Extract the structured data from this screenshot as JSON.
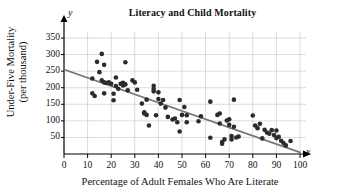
{
  "chart_data": {
    "type": "scatter",
    "title": "Literacy and Child Mortality",
    "xlabel": "Percentage of Adult Females Who Are Literate",
    "ylabel_line1": "Under-Five Mortality",
    "ylabel_line2": "(per thousand)",
    "x_axis_symbol": "x",
    "y_axis_symbol": "y",
    "xlim": [
      0,
      100
    ],
    "ylim": [
      0,
      365
    ],
    "xticks": [
      0,
      10,
      20,
      30,
      40,
      50,
      60,
      70,
      80,
      90,
      100
    ],
    "yticks": [
      50,
      100,
      150,
      200,
      250,
      300,
      350
    ],
    "grid": true,
    "grid_color": "#cccccc",
    "point_color": "#2b2b2b",
    "line_color": "#777777",
    "axis_color": "#000000",
    "trendline": {
      "label": "least-squares regression line",
      "x_start": 0,
      "y_start": 255,
      "x_end": 100,
      "y_end": 5
    },
    "points": [
      [
        12,
        228
      ],
      [
        12,
        183
      ],
      [
        13,
        175
      ],
      [
        14,
        278
      ],
      [
        15,
        247
      ],
      [
        16,
        302
      ],
      [
        16,
        222
      ],
      [
        17,
        269
      ],
      [
        17,
        216
      ],
      [
        17,
        183
      ],
      [
        18,
        214
      ],
      [
        19,
        216
      ],
      [
        20,
        212
      ],
      [
        21,
        182
      ],
      [
        21,
        162
      ],
      [
        22,
        231
      ],
      [
        22,
        205
      ],
      [
        23,
        197
      ],
      [
        24,
        212
      ],
      [
        25,
        215
      ],
      [
        25,
        207
      ],
      [
        26,
        277
      ],
      [
        26,
        210
      ],
      [
        27,
        192
      ],
      [
        29,
        222
      ],
      [
        30,
        216
      ],
      [
        31,
        194
      ],
      [
        33,
        152
      ],
      [
        34,
        126
      ],
      [
        34,
        122
      ],
      [
        35,
        164
      ],
      [
        35,
        118
      ],
      [
        36,
        86
      ],
      [
        38,
        206
      ],
      [
        38,
        196
      ],
      [
        38,
        189
      ],
      [
        39,
        117
      ],
      [
        40,
        186
      ],
      [
        40,
        166
      ],
      [
        41,
        152
      ],
      [
        42,
        163
      ],
      [
        43,
        140
      ],
      [
        44,
        112
      ],
      [
        46,
        104
      ],
      [
        47,
        107
      ],
      [
        48,
        96
      ],
      [
        49,
        163
      ],
      [
        49,
        68
      ],
      [
        50,
        118
      ],
      [
        51,
        142
      ],
      [
        52,
        117
      ],
      [
        52,
        96
      ],
      [
        57,
        99
      ],
      [
        58,
        114
      ],
      [
        62,
        158
      ],
      [
        62,
        49
      ],
      [
        65,
        118
      ],
      [
        66,
        122
      ],
      [
        66,
        92
      ],
      [
        67,
        36
      ],
      [
        67,
        31
      ],
      [
        68,
        44
      ],
      [
        69,
        101
      ],
      [
        70,
        105
      ],
      [
        70,
        88
      ],
      [
        71,
        54
      ],
      [
        71,
        44
      ],
      [
        72,
        164
      ],
      [
        72,
        82
      ],
      [
        73,
        50
      ],
      [
        74,
        53
      ],
      [
        80,
        116
      ],
      [
        81,
        86
      ],
      [
        82,
        78
      ],
      [
        83,
        91
      ],
      [
        84,
        47
      ],
      [
        85,
        73
      ],
      [
        86,
        65
      ],
      [
        87,
        61
      ],
      [
        88,
        72
      ],
      [
        89,
        57
      ],
      [
        90,
        71
      ],
      [
        90,
        48
      ],
      [
        91,
        52
      ],
      [
        92,
        40
      ],
      [
        93,
        33
      ],
      [
        94,
        26
      ],
      [
        96,
        39
      ]
    ]
  }
}
